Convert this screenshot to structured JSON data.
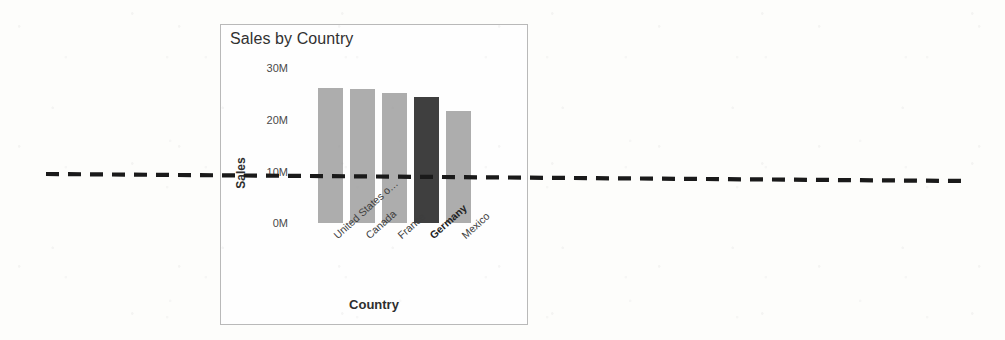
{
  "chart": {
    "title": "Sales by Country",
    "xlabel": "Country",
    "ylabel": "Sales",
    "frame_border_color": "#b9b9b9",
    "background_color": "#fdfdfb"
  },
  "annotation": {
    "name": "dashed-horizontal-line",
    "color": "#1a1a1a",
    "style": "dashed",
    "value_label": "10M"
  },
  "chart_data": {
    "type": "bar",
    "title": "Sales by Country",
    "xlabel": "Country",
    "ylabel": "Sales",
    "categories": [
      "United States o…",
      "Canada",
      "France",
      "Germany",
      "Mexico"
    ],
    "values": [
      26.1,
      25.9,
      25.1,
      24.4,
      21.7
    ],
    "value_unit": "M",
    "ylim": [
      0,
      30
    ],
    "yticks": [
      0,
      10,
      20,
      30
    ],
    "ytick_labels": [
      "0M",
      "10M",
      "20M",
      "30M"
    ],
    "grid": false,
    "legend": false,
    "highlighted_category": "Germany",
    "bar_color": "#adadad",
    "highlight_color": "#3f3f3f",
    "annotation_line_y": 10
  }
}
